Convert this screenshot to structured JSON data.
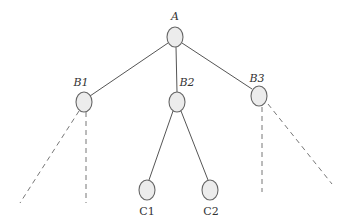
{
  "diagram": {
    "type": "tree",
    "nodes": [
      {
        "id": "A",
        "label": "A",
        "italic": true,
        "cx": 175,
        "cy": 37,
        "lx": 175,
        "ly": 20
      },
      {
        "id": "B1",
        "label": "B1",
        "italic": true,
        "cx": 84,
        "cy": 102,
        "lx": 81,
        "ly": 86
      },
      {
        "id": "B2",
        "label": "B2",
        "italic": true,
        "cx": 177,
        "cy": 102,
        "lx": 187,
        "ly": 86
      },
      {
        "id": "B3",
        "label": "B3",
        "italic": true,
        "cx": 259,
        "cy": 96,
        "lx": 257,
        "ly": 82
      },
      {
        "id": "C1",
        "label": "C1",
        "italic": false,
        "cx": 147,
        "cy": 190,
        "lx": 147,
        "ly": 215
      },
      {
        "id": "C2",
        "label": "C2",
        "italic": false,
        "cx": 210,
        "cy": 190,
        "lx": 211,
        "ly": 215
      }
    ],
    "edges": [
      {
        "from": "A",
        "to": "B1",
        "style": "solid"
      },
      {
        "from": "A",
        "to": "B2",
        "style": "solid"
      },
      {
        "from": "A",
        "to": "B3",
        "style": "solid"
      },
      {
        "from": "B2",
        "to": "C1",
        "style": "solid"
      },
      {
        "from": "B2",
        "to": "C2",
        "style": "solid"
      }
    ],
    "dashed_continuations": [
      {
        "from": "B1",
        "to_point": [
          20,
          203
        ]
      },
      {
        "from": "B1",
        "to_point": [
          86,
          203
        ]
      },
      {
        "from": "B3",
        "to_point": [
          262,
          192
        ]
      },
      {
        "from": "B3",
        "to_point": [
          332,
          184
        ]
      }
    ],
    "colors": {
      "node_fill": "#ececec",
      "node_stroke": "#666666",
      "edge": "#555555",
      "dashed": "#777777",
      "text": "#333333"
    }
  }
}
